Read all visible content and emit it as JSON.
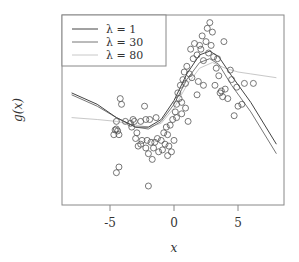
{
  "chart_data": {
    "type": "scatter",
    "title": "",
    "xlabel": "x",
    "ylabel": "g(x)",
    "xlim": [
      -8.6,
      8.7
    ],
    "ylim": [
      -5,
      5
    ],
    "x_ticks": [
      -5,
      0,
      5
    ],
    "x_tick_labels": [
      "-5",
      "0",
      "5"
    ],
    "y_ticks": [],
    "grid": false,
    "legend_position": "upper left",
    "legend": [
      {
        "label": "λ = 1",
        "color": "#444444"
      },
      {
        "label": "λ = 30",
        "color": "#777777"
      },
      {
        "label": "λ = 80",
        "color": "#c8c8c8"
      }
    ],
    "points": [
      [
        -4.5,
        -1.0
      ],
      [
        -4.4,
        -1.1
      ],
      [
        -4.6,
        -1.05
      ],
      [
        -4.3,
        -1.3
      ],
      [
        -4.5,
        -0.6
      ],
      [
        -4.2,
        0.6
      ],
      [
        -4.1,
        0.3
      ],
      [
        -4.7,
        -1.3
      ],
      [
        -3.8,
        -0.6
      ],
      [
        -3.4,
        -0.7
      ],
      [
        -3.2,
        -0.5
      ],
      [
        -3.1,
        -0.6
      ],
      [
        -3.3,
        -0.9
      ],
      [
        -2.9,
        -1.2
      ],
      [
        -2.6,
        -0.6
      ],
      [
        -2.3,
        0.2
      ],
      [
        -2.2,
        -0.5
      ],
      [
        -1.9,
        -0.5
      ],
      [
        -2.5,
        -1.6
      ],
      [
        -2.8,
        -1.9
      ],
      [
        -3.0,
        -1.5
      ],
      [
        -2.6,
        -1.8
      ],
      [
        -2.1,
        -1.6
      ],
      [
        -1.8,
        -1.7
      ],
      [
        -2.2,
        -2.0
      ],
      [
        -2.0,
        -2.3
      ],
      [
        -1.6,
        -2.0
      ],
      [
        -1.5,
        -1.7
      ],
      [
        -1.3,
        -1.5
      ],
      [
        -1.0,
        -1.6
      ],
      [
        -1.2,
        -2.2
      ],
      [
        -0.9,
        -2.1
      ],
      [
        -1.7,
        -2.6
      ],
      [
        -0.8,
        -1.2
      ],
      [
        -0.5,
        -1.3
      ],
      [
        -0.7,
        -1.8
      ],
      [
        -4.3,
        -3.0
      ],
      [
        -4.5,
        -3.3
      ],
      [
        -2.0,
        -4.0
      ],
      [
        -0.3,
        -0.8
      ],
      [
        -0.1,
        -0.5
      ],
      [
        0.1,
        -0.1
      ],
      [
        0.2,
        0.3
      ],
      [
        0.4,
        0.6
      ],
      [
        0.6,
        0.4
      ],
      [
        0.3,
        0.9
      ],
      [
        0.5,
        1.3
      ],
      [
        0.7,
        1.6
      ],
      [
        0.9,
        1.4
      ],
      [
        0.8,
        2.0
      ],
      [
        1.0,
        2.3
      ],
      [
        1.2,
        1.9
      ],
      [
        0.6,
        -0.2
      ],
      [
        1.1,
        -0.6
      ],
      [
        -0.5,
        -2.4
      ],
      [
        -0.2,
        -2.2
      ],
      [
        -0.4,
        -1.9
      ],
      [
        0.0,
        -1.6
      ],
      [
        1.3,
        3.2
      ],
      [
        1.5,
        2.7
      ],
      [
        1.6,
        3.5
      ],
      [
        1.8,
        2.9
      ],
      [
        2.1,
        3.2
      ],
      [
        2.3,
        2.6
      ],
      [
        2.5,
        3.6
      ],
      [
        2.7,
        3.0
      ],
      [
        2.9,
        3.4
      ],
      [
        3.1,
        2.8
      ],
      [
        3.3,
        2.2
      ],
      [
        2.6,
        4.3
      ],
      [
        2.8,
        4.6
      ],
      [
        3.0,
        4.1
      ],
      [
        2.2,
        3.9
      ],
      [
        1.9,
        1.5
      ],
      [
        2.3,
        1.3
      ],
      [
        1.8,
        0.8
      ],
      [
        3.2,
        1.3
      ],
      [
        3.5,
        1.8
      ],
      [
        3.7,
        1.0
      ],
      [
        3.8,
        0.7
      ],
      [
        4.2,
        0.6
      ],
      [
        4.0,
        1.1
      ],
      [
        4.5,
        1.6
      ],
      [
        3.6,
        0.9
      ],
      [
        5.0,
        0.2
      ],
      [
        5.3,
        0.3
      ],
      [
        4.7,
        -0.3
      ],
      [
        4.9,
        1.2
      ],
      [
        5.5,
        1.4
      ],
      [
        6.2,
        1.4
      ],
      [
        4.4,
        2.1
      ],
      [
        3.4,
        2.7
      ],
      [
        3.9,
        3.6
      ],
      [
        2.0,
        3.4
      ],
      [
        1.4,
        1.7
      ],
      [
        0.9,
        0.1
      ],
      [
        0.2,
        -0.4
      ],
      [
        -0.6,
        -0.9
      ],
      [
        -1.4,
        -0.4
      ]
    ],
    "series": [
      {
        "name": "λ = 1",
        "color": "#444444",
        "x": [
          -8,
          -6,
          -4.5,
          -3,
          -2,
          -1,
          0,
          1,
          2,
          2.8,
          3.5,
          4.5,
          6,
          8
        ],
        "y": [
          0.9,
          0.3,
          -0.4,
          -0.9,
          -0.9,
          -0.5,
          0.5,
          1.9,
          2.9,
          3.1,
          2.8,
          1.8,
          0.4,
          -1.8
        ]
      },
      {
        "name": "λ = 30",
        "color": "#777777",
        "x": [
          -8,
          -6,
          -4.5,
          -3,
          -2,
          -1,
          0,
          1,
          2,
          2.8,
          3.5,
          4.5,
          6,
          8
        ],
        "y": [
          0.8,
          0.2,
          -0.4,
          -0.9,
          -1.0,
          -0.6,
          0.3,
          1.6,
          2.5,
          2.7,
          2.4,
          1.3,
          -0.1,
          -2.3
        ]
      },
      {
        "name": "λ = 80",
        "color": "#c8c8c8",
        "x": [
          -8,
          -6,
          -4.5,
          -3,
          -2,
          -1,
          0,
          1,
          2,
          3,
          4,
          5,
          6,
          8
        ],
        "y": [
          -0.4,
          -0.5,
          -0.6,
          -0.8,
          -0.9,
          -0.7,
          0.1,
          1.3,
          2.2,
          2.5,
          2.2,
          2.0,
          1.9,
          1.7
        ]
      }
    ]
  }
}
